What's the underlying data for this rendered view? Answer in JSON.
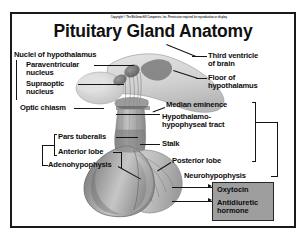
{
  "figure": {
    "copyright": "Copyright © The McGraw-Hill Companies, Inc. Permission required for reproduction or display.",
    "title": "Pituitary Gland Anatomy"
  },
  "labels": {
    "left": {
      "nuclei_group": "Nuclei of hypothalamus",
      "paraventricular": "Paraventricular\nnucleus",
      "supraoptic": "Supraoptic\nnucleus",
      "optic_chiasm": "Optic chiasm",
      "pars_tuberalis": "Pars tuberalis",
      "anterior_lobe": "Anterior lobe",
      "adenohypophysis": "Adenohypophysis"
    },
    "right": {
      "third_ventricle": "Third ventricle\nof brain",
      "floor_hypothalamus": "Floor of\nhypothalamus",
      "median_eminence": "Median eminence",
      "hypothalamo_hypophyseal_tract": "Hypothalamo-\nhypophyseal tract",
      "stalk": "Stalk",
      "posterior_lobe": "Posterior lobe",
      "neurohypophysis": "Neurohypophysis"
    }
  },
  "hormone_box": {
    "oxytocin": "Oxytocin",
    "antidiuretic_hormone": "Antidiuretic\nhormone",
    "background_color": "#9e9e9e"
  },
  "colors": {
    "frame": "#1a1a1a",
    "text": "#0d0d0d",
    "leader_line": "#141414",
    "page_background": "#ffffff"
  }
}
